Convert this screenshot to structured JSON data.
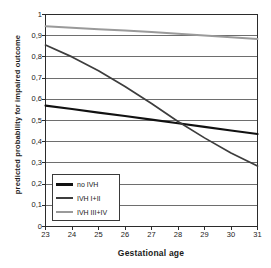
{
  "chart_data": {
    "type": "line",
    "title": "",
    "xlabel": "Gestational age",
    "ylabel": "predicted probability for impaired outcome",
    "xlim": [
      23,
      31
    ],
    "ylim": [
      0,
      1
    ],
    "grid": "horizontal",
    "legend_position": "lower-left-inside",
    "x": [
      23,
      24,
      25,
      26,
      27,
      28,
      29,
      30,
      31
    ],
    "xticklabels": [
      "23",
      "24",
      "25",
      "26",
      "27",
      "28",
      "29",
      "30",
      "31"
    ],
    "yticks": [
      0,
      0.1,
      0.2,
      0.3,
      0.4,
      0.5,
      0.6,
      0.7,
      0.8,
      0.9,
      1
    ],
    "yticklabels": [
      "0",
      "0,1",
      "0,2",
      "0,3",
      "0,4",
      "0,5",
      "0,6",
      "0,7",
      "0,8",
      "0,9",
      "1"
    ],
    "series": [
      {
        "name": "no IVH",
        "color": "#111111",
        "width": 2.1,
        "values": [
          0.57,
          0.554,
          0.537,
          0.521,
          0.504,
          0.487,
          0.47,
          0.453,
          0.436
        ]
      },
      {
        "name": "IVH I+II",
        "color": "#3d3d3d",
        "width": 1.7,
        "values": [
          0.856,
          0.8,
          0.735,
          0.66,
          0.58,
          0.495,
          0.418,
          0.347,
          0.285
        ]
      },
      {
        "name": "IVH III+IV",
        "color": "#9a9a9a",
        "width": 2.0,
        "values": [
          0.945,
          0.938,
          0.931,
          0.924,
          0.917,
          0.909,
          0.901,
          0.893,
          0.885
        ]
      }
    ]
  },
  "axes": {
    "ylabel_text": "predicted probability for impaired outcome",
    "xlabel_text": "Gestational age"
  },
  "legend": {
    "items": [
      {
        "label": "no IVH",
        "color": "#111111",
        "thickness": "3px"
      },
      {
        "label": "IVH I+II",
        "color": "#3d3d3d",
        "thickness": "2px"
      },
      {
        "label": "IVH III+IV",
        "color": "#9a9a9a",
        "thickness": "2px"
      }
    ]
  }
}
